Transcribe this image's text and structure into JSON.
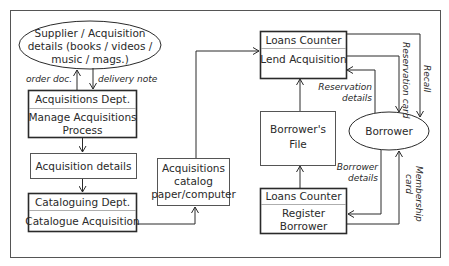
{
  "diagram": {
    "type": "data-flow",
    "nodes": {
      "supplier": {
        "shape": "ellipse",
        "lines": [
          "Supplier / Acquisition",
          "details  (books / videos /",
          "music / mags.)"
        ]
      },
      "acq_dept": {
        "shape": "process",
        "header": "Acquisitions Dept.",
        "lines": [
          "Manage Acquisitions",
          "Process"
        ]
      },
      "acq_details": {
        "shape": "store",
        "lines": [
          "Acquisition details"
        ]
      },
      "cat_dept": {
        "shape": "process",
        "header": "Cataloguing Dept.",
        "lines": [
          "Catalogue Acquisition"
        ]
      },
      "acq_catalog": {
        "shape": "store",
        "lines": [
          "Acquisitions",
          "catalog",
          "paper/computer"
        ]
      },
      "loans_lend": {
        "shape": "process",
        "header": "Loans Counter",
        "lines": [
          "Lend Acquisition"
        ]
      },
      "borrowers_file": {
        "shape": "store",
        "lines": [
          "Borrower's",
          "File"
        ]
      },
      "borrower": {
        "shape": "ellipse",
        "lines": [
          "Borrower"
        ]
      },
      "loans_register": {
        "shape": "process",
        "header": "Loans Counter",
        "lines": [
          "Register",
          "Borrower"
        ]
      }
    },
    "flows": {
      "order_doc": "order doc.",
      "delivery_note": "delivery note",
      "reservation_details": [
        "Reservation",
        "details"
      ],
      "reservation_card": "Reservation card",
      "recall": "Recall",
      "borrower_details": [
        "Borrower",
        "details"
      ],
      "membership_card": [
        "Membership",
        "card"
      ]
    },
    "colors": {
      "stroke": "#2a2a2a",
      "background": "#ffffff",
      "frame": "#555555"
    }
  }
}
